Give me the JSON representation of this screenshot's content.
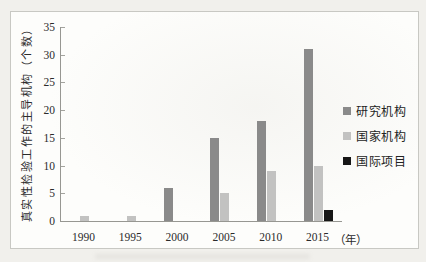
{
  "figure": {
    "page_background": "#f1f0ec",
    "panel_background": "#fdfdfb",
    "panel_border_color": "#c8c8c3",
    "axis_color": "#979792",
    "text_color": "#2b2b2b"
  },
  "chart_data": {
    "type": "bar",
    "title": "",
    "categories": [
      "1990",
      "1995",
      "2000",
      "2005",
      "2010",
      "2015"
    ],
    "series": [
      {
        "name": "研究机构",
        "color": "#8a8a8a",
        "values": [
          0,
          0,
          6,
          15,
          18,
          31
        ]
      },
      {
        "name": "国家机构",
        "color": "#c2c2c1",
        "values": [
          1,
          1,
          0,
          5,
          9,
          10
        ]
      },
      {
        "name": "国际项目",
        "color": "#161616",
        "values": [
          0,
          0,
          0,
          0,
          0,
          2
        ]
      }
    ],
    "ylabel": "真实性检验工作的主导机构（个数）",
    "xlabel_suffix": "（年）",
    "ylim": [
      0,
      35
    ],
    "ytick_step": 5,
    "yticks": [
      0,
      5,
      10,
      15,
      20,
      25,
      30,
      35
    ],
    "grid": false,
    "legend_position": "right"
  }
}
